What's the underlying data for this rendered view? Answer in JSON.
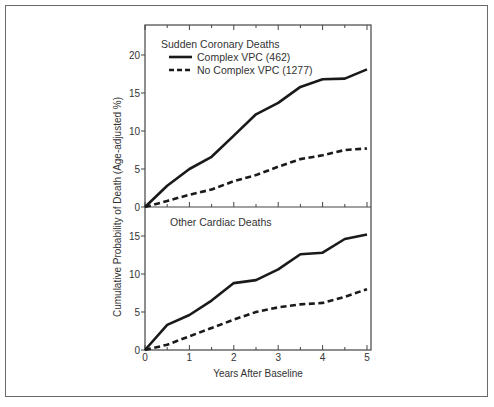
{
  "chart_data": [
    {
      "type": "line",
      "title": "Sudden Coronary Deaths",
      "xlabel": "Years After Baseline",
      "ylabel": "Cumulative Probability of Death (Age-adjusted %)",
      "x": [
        0,
        0.5,
        1,
        1.5,
        2,
        2.5,
        3,
        3.5,
        4,
        4.5,
        5
      ],
      "xticks": [
        0,
        1,
        2,
        3,
        4,
        5
      ],
      "yticks": [
        0,
        5,
        10,
        15,
        20
      ],
      "ylim": [
        0,
        23
      ],
      "xlim": [
        0,
        5
      ],
      "legend_position": "upper-left",
      "grid": false,
      "series": [
        {
          "name": "Complex VPC (462)",
          "style": "solid",
          "values": [
            0,
            2.8,
            5.0,
            6.6,
            9.4,
            12.2,
            13.7,
            15.8,
            16.8,
            16.9,
            18.1
          ]
        },
        {
          "name": "No Complex VPC (1277)",
          "style": "dashed",
          "values": [
            0,
            0.8,
            1.6,
            2.3,
            3.4,
            4.2,
            5.3,
            6.3,
            6.8,
            7.5,
            7.7
          ]
        }
      ]
    },
    {
      "type": "line",
      "title": "Other Cardiac Deaths",
      "xlabel": "Years After Baseline",
      "ylabel": "Cumulative Probability of Death (Age-adjusted %)",
      "x": [
        0,
        0.5,
        1,
        1.5,
        2,
        2.5,
        3,
        3.5,
        4,
        4.5,
        5
      ],
      "xticks": [
        0,
        1,
        2,
        3,
        4,
        5
      ],
      "yticks": [
        0,
        5,
        10,
        15
      ],
      "ylim": [
        0,
        18
      ],
      "xlim": [
        0,
        5
      ],
      "grid": false,
      "series": [
        {
          "name": "Complex VPC (462)",
          "style": "solid",
          "values": [
            0,
            3.3,
            4.6,
            6.5,
            8.8,
            9.2,
            10.6,
            12.6,
            12.8,
            14.6,
            15.2
          ]
        },
        {
          "name": "No Complex VPC (1277)",
          "style": "dashed",
          "values": [
            0,
            0.7,
            1.8,
            2.9,
            4.0,
            5.0,
            5.6,
            6.0,
            6.2,
            7.0,
            8.0
          ]
        }
      ]
    }
  ],
  "labels": {
    "top_title": "Sudden Coronary Deaths",
    "bottom_title": "Other Cardiac Deaths",
    "legend_solid": "Complex VPC (462)",
    "legend_dashed": "No Complex VPC (1277)",
    "xlabel": "Years After Baseline",
    "ylabel": "Cumulative Probability of Death (Age-adjusted %)"
  },
  "colors": {
    "line": "#1a1a1a",
    "axis": "#444444",
    "frame": "#6a6a6a"
  }
}
